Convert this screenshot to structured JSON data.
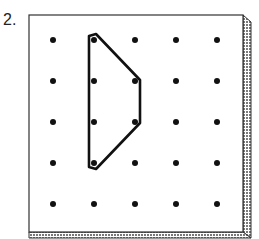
{
  "problem": {
    "number_label": "2."
  },
  "geoboard": {
    "rows": 5,
    "cols": 5,
    "peg_columns_x": [
      53,
      94,
      135,
      176,
      217
    ],
    "peg_rows_y": [
      40,
      81,
      122,
      163,
      204
    ],
    "board_color": "#ffffff",
    "edge_color": "#333333",
    "shadow_pattern_color": "#888888"
  },
  "rubber_band": {
    "shape": "trapezoid",
    "vertices_grid": [
      [
        1,
        0
      ],
      [
        2,
        1
      ],
      [
        2,
        2
      ],
      [
        1,
        3
      ]
    ],
    "stroke_color": "#111111"
  }
}
